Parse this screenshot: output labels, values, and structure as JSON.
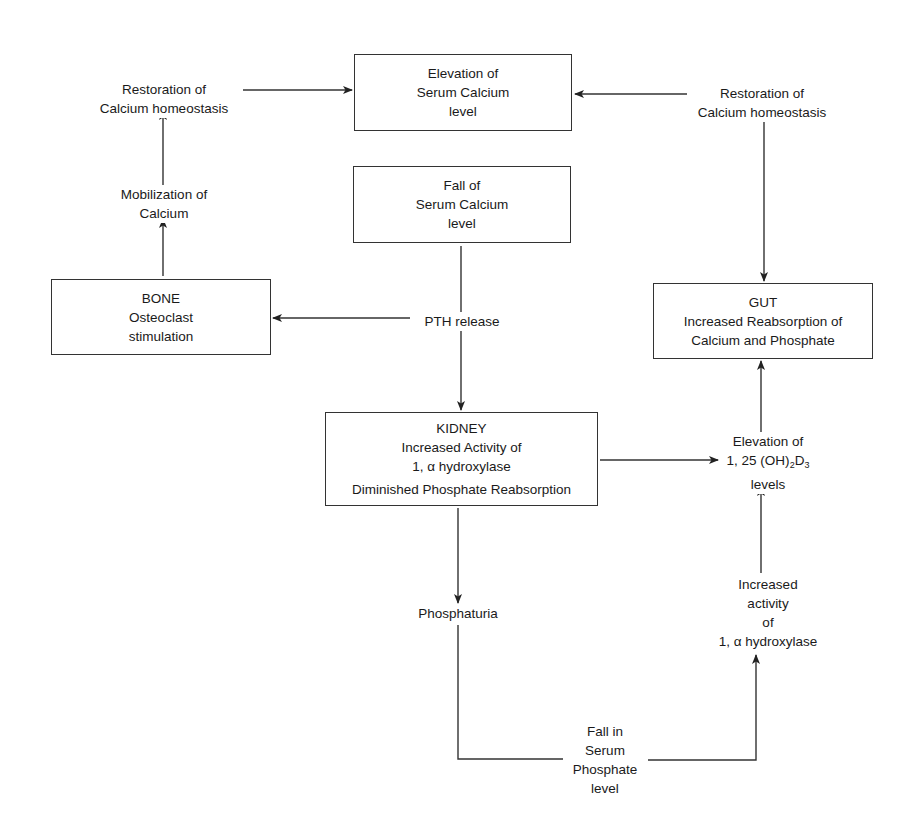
{
  "diagram": {
    "nodes": {
      "elevation_serum_calcium": {
        "lines": [
          "Elevation of",
          "Serum Calcium",
          "level"
        ]
      },
      "fall_serum_calcium": {
        "lines": [
          "Fall of",
          "Serum Calcium",
          "level"
        ]
      },
      "bone": {
        "lines": [
          "BONE",
          "Osteoclast",
          "stimulation"
        ]
      },
      "gut": {
        "lines": [
          "GUT",
          "Increased Reabsorption of",
          "Calcium and Phosphate"
        ]
      },
      "kidney": {
        "lines": [
          "KIDNEY",
          "Increased Activity of",
          "1, α hydroxylase",
          "Diminished Phosphate Reabsorption"
        ]
      },
      "restoration_left": {
        "lines": [
          "Restoration of",
          "Calcium homeostasis"
        ]
      },
      "restoration_right": {
        "lines": [
          "Restoration of",
          "Calcium homeostasis"
        ]
      },
      "mobilization": {
        "lines": [
          "Mobilization of",
          "Calcium"
        ]
      },
      "pth_release": {
        "lines": [
          "PTH release"
        ]
      },
      "elevation_vitd": {
        "line1": "Elevation of",
        "line2_prefix": "1, 25 (OH)",
        "sub1": "2",
        "line2_mid": "D",
        "sub2": "3",
        "line3": "levels"
      },
      "increased_activity": {
        "lines": [
          "Increased",
          "activity",
          "of",
          "1, α hydroxylase"
        ]
      },
      "phosphaturia": {
        "lines": [
          "Phosphaturia"
        ]
      },
      "fall_serum_phosphate": {
        "lines": [
          "Fall in",
          "Serum",
          "Phosphate",
          "level"
        ]
      }
    },
    "edges": [
      {
        "from": "restoration_left",
        "to": "elevation_serum_calcium"
      },
      {
        "from": "restoration_right",
        "to": "elevation_serum_calcium"
      },
      {
        "from": "restoration_right",
        "to": "gut"
      },
      {
        "from": "mobilization",
        "to": "restoration_left"
      },
      {
        "from": "bone",
        "to": "mobilization"
      },
      {
        "from": "fall_serum_calcium",
        "to": "pth_release"
      },
      {
        "from": "pth_release",
        "to": "bone"
      },
      {
        "from": "pth_release",
        "to": "kidney"
      },
      {
        "from": "kidney",
        "to": "elevation_vitd"
      },
      {
        "from": "elevation_vitd",
        "to": "gut"
      },
      {
        "from": "increased_activity",
        "to": "elevation_vitd"
      },
      {
        "from": "kidney",
        "to": "phosphaturia"
      },
      {
        "from": "phosphaturia",
        "to": "fall_serum_phosphate"
      },
      {
        "from": "fall_serum_phosphate",
        "to": "increased_activity"
      }
    ],
    "colors": {
      "stroke": "#333333",
      "text": "#1a1a1a",
      "background": "#ffffff"
    }
  }
}
